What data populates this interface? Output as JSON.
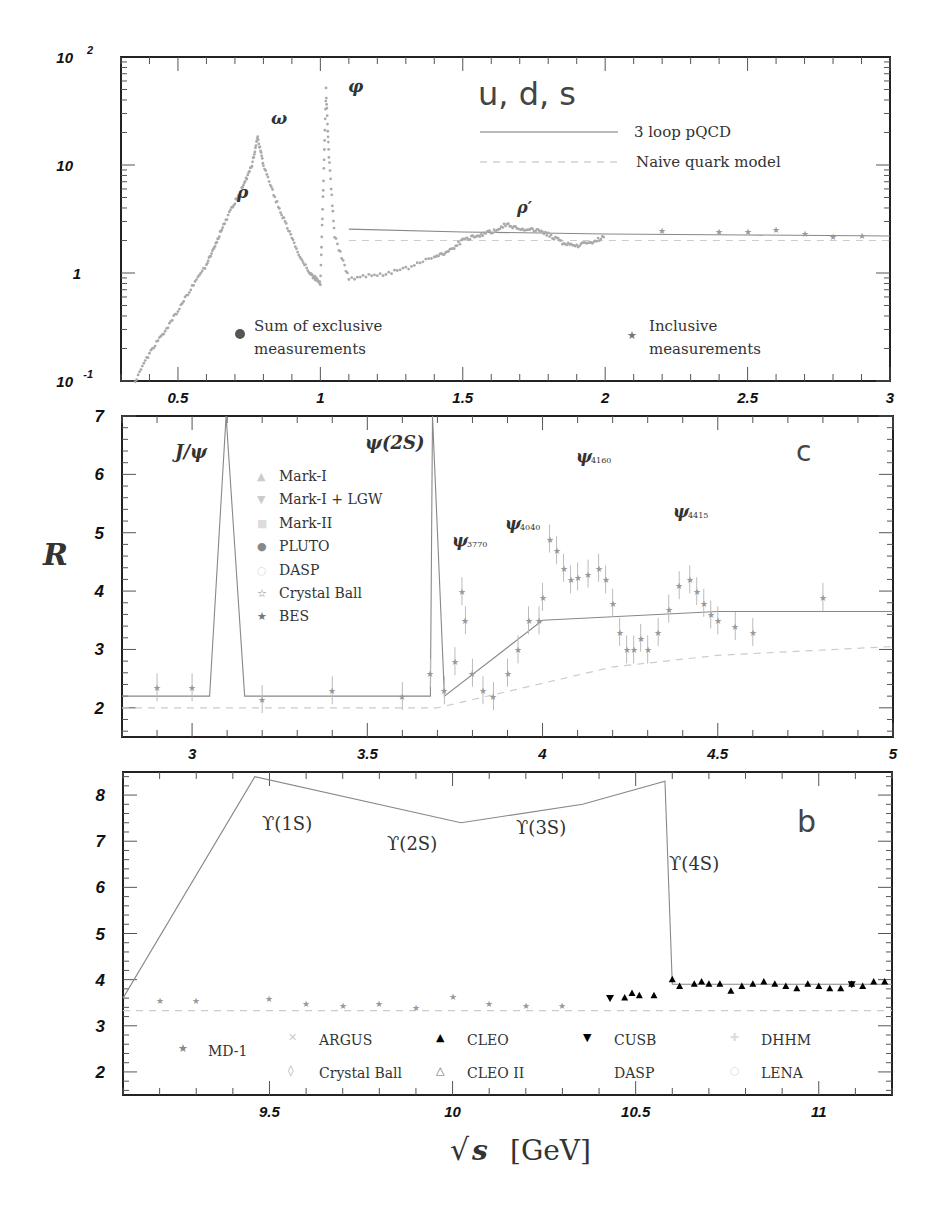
{
  "figure": {
    "y_axis_label": "R",
    "x_axis_label": "√s [GeV]",
    "x_axis_label_var": "s",
    "x_axis_label_unit": "[GeV]"
  },
  "chart_data": [
    {
      "panel": "top",
      "type": "scatter",
      "title": "u, d, s",
      "yscale": "log",
      "xlim": [
        0.3,
        3
      ],
      "ylim": [
        0.1,
        100
      ],
      "xticks": [
        "0.5",
        "1",
        "1.5",
        "2",
        "2.5",
        "3"
      ],
      "yticks": [
        "10^-1",
        "1",
        "10",
        "10^2"
      ],
      "annotations": [
        "ρ",
        "ω",
        "φ",
        "ρ′"
      ],
      "legend": [
        {
          "label": "3 loop pQCD",
          "style": "solid line"
        },
        {
          "label": "Naive quark model",
          "style": "dashed line"
        },
        {
          "label": "Sum of exclusive measurements",
          "marker": "filled circle"
        },
        {
          "label": "Inclusive measurements",
          "marker": "star"
        }
      ],
      "series": [
        {
          "name": "Sum of exclusive measurements",
          "x": [
            0.35,
            0.4,
            0.45,
            0.5,
            0.55,
            0.6,
            0.63,
            0.66,
            0.7,
            0.73,
            0.76,
            0.78,
            0.8,
            0.84,
            0.88,
            0.92,
            0.96,
            0.98,
            1.0,
            1.01,
            1.02,
            1.03,
            1.05,
            1.1,
            1.2,
            1.3,
            1.4,
            1.45,
            1.5,
            1.55,
            1.6,
            1.65,
            1.7,
            1.75,
            1.8,
            1.85,
            1.9,
            1.95,
            2.0
          ],
          "y": [
            0.1,
            0.18,
            0.28,
            0.45,
            0.75,
            1.2,
            1.8,
            2.8,
            4.5,
            6.5,
            10,
            18,
            10,
            5,
            2.8,
            1.6,
            1.0,
            0.9,
            0.8,
            6,
            50,
            12,
            2.2,
            0.9,
            0.95,
            1.1,
            1.4,
            1.6,
            2.0,
            2.2,
            2.4,
            2.8,
            2.6,
            2.5,
            2.3,
            1.9,
            1.8,
            1.9,
            2.2
          ]
        },
        {
          "name": "Inclusive measurements",
          "x": [
            2.2,
            2.4,
            2.5,
            2.6,
            2.7,
            2.8,
            2.9
          ],
          "y": [
            2.5,
            2.45,
            2.45,
            2.55,
            2.35,
            2.2,
            2.25
          ]
        },
        {
          "name": "3 loop pQCD",
          "x": [
            1.1,
            1.5,
            2.0,
            2.5,
            3.0
          ],
          "y": [
            2.55,
            2.4,
            2.3,
            2.25,
            2.2
          ]
        },
        {
          "name": "Naive quark model",
          "x": [
            1.1,
            3.0
          ],
          "y": [
            2.0,
            2.0
          ]
        }
      ]
    },
    {
      "panel": "middle",
      "type": "scatter",
      "label": "c",
      "xlim": [
        2.8,
        5
      ],
      "ylim": [
        1.5,
        7
      ],
      "xticks": [
        "3",
        "3.5",
        "4",
        "4.5",
        "5"
      ],
      "yticks": [
        "2",
        "3",
        "4",
        "5",
        "6",
        "7"
      ],
      "annotations": [
        "J/ψ",
        "ψ(2S)",
        "ψ3770",
        "ψ4040",
        "ψ4160",
        "ψ4415"
      ],
      "legend": [
        "Mark-I",
        "Mark-I + LGW",
        "Mark-II",
        "PLUTO",
        "DASP",
        "Crystal Ball",
        "BES"
      ],
      "series": [
        {
          "name": "data",
          "x": [
            2.9,
            3.0,
            3.2,
            3.4,
            3.6,
            3.68,
            3.72,
            3.75,
            3.77,
            3.78,
            3.8,
            3.83,
            3.86,
            3.9,
            3.93,
            3.96,
            3.99,
            4.0,
            4.02,
            4.04,
            4.06,
            4.08,
            4.1,
            4.13,
            4.16,
            4.18,
            4.2,
            4.22,
            4.24,
            4.26,
            4.28,
            4.3,
            4.33,
            4.36,
            4.39,
            4.42,
            4.44,
            4.46,
            4.48,
            4.5,
            4.55,
            4.6,
            4.8
          ],
          "y": [
            2.35,
            2.35,
            2.15,
            2.3,
            2.2,
            2.6,
            2.3,
            2.8,
            4.0,
            3.5,
            2.6,
            2.3,
            2.2,
            2.6,
            3.0,
            3.5,
            3.5,
            3.9,
            4.9,
            4.7,
            4.4,
            4.2,
            4.25,
            4.3,
            4.4,
            4.2,
            3.8,
            3.3,
            3.0,
            3.0,
            3.2,
            3.0,
            3.3,
            3.7,
            4.1,
            4.2,
            4.0,
            3.8,
            3.6,
            3.5,
            3.4,
            3.3,
            3.9
          ]
        },
        {
          "name": "3 loop pQCD",
          "x": [
            2.8,
            3.05,
            3.097,
            3.15,
            3.68,
            3.686,
            3.72,
            4.0,
            4.5,
            5.0
          ],
          "y": [
            2.2,
            2.2,
            7,
            2.2,
            2.2,
            7,
            2.2,
            3.5,
            3.65,
            3.65
          ]
        },
        {
          "name": "Naive quark model",
          "x": [
            2.8,
            3.7,
            3.95,
            4.2,
            4.5,
            5.0
          ],
          "y": [
            2.0,
            2.0,
            2.35,
            2.7,
            2.9,
            3.05
          ]
        }
      ]
    },
    {
      "panel": "bottom",
      "type": "scatter",
      "label": "b",
      "xlim": [
        9.1,
        11.2
      ],
      "ylim": [
        1.5,
        8.5
      ],
      "xticks": [
        "9.5",
        "10",
        "10.5",
        "11"
      ],
      "yticks": [
        "2",
        "3",
        "4",
        "5",
        "6",
        "7",
        "8"
      ],
      "annotations": [
        "ϒ(1S)",
        "ϒ(2S)",
        "ϒ(3S)",
        "ϒ(4S)"
      ],
      "legend": [
        "MD-1",
        "ARGUS",
        "Crystal Ball",
        "CLEO",
        "CLEO II",
        "CUSB",
        "DASP",
        "DHHM",
        "LENA"
      ],
      "series": [
        {
          "name": "MD-1",
          "x": [
            9.2,
            9.3,
            9.5,
            9.6,
            9.7,
            9.8,
            9.9,
            10.0,
            10.1,
            10.2,
            10.3
          ],
          "y": [
            3.55,
            3.55,
            3.6,
            3.5,
            3.45,
            3.5,
            3.4,
            3.65,
            3.5,
            3.45,
            3.45
          ]
        },
        {
          "name": "CLEO",
          "x": [
            10.47,
            10.49,
            10.51,
            10.55,
            10.6,
            10.62,
            10.66,
            10.68,
            10.7,
            10.73,
            10.76,
            10.79,
            10.82,
            10.85,
            10.88,
            10.91,
            10.94,
            10.97,
            11.0,
            11.03,
            11.06,
            11.09,
            11.12,
            11.15,
            11.18
          ],
          "y": [
            3.6,
            3.7,
            3.65,
            3.65,
            4.0,
            3.85,
            3.9,
            3.95,
            3.9,
            3.9,
            3.75,
            3.85,
            3.9,
            3.95,
            3.9,
            3.85,
            3.8,
            3.9,
            3.85,
            3.8,
            3.8,
            3.9,
            3.85,
            3.95,
            3.95
          ]
        },
        {
          "name": "CUSB",
          "x": [
            10.43,
            11.09
          ],
          "y": [
            3.6,
            3.9
          ]
        },
        {
          "name": "3 loop pQCD",
          "x": [
            9.1,
            9.46,
            10.023,
            10.355,
            10.58,
            10.6,
            11.2
          ],
          "y": [
            3.6,
            8.4,
            7.4,
            7.8,
            8.3,
            3.9,
            3.9
          ]
        },
        {
          "name": "Naive quark model",
          "x": [
            9.1,
            11.2
          ],
          "y": [
            3.33,
            3.33
          ]
        }
      ]
    }
  ]
}
